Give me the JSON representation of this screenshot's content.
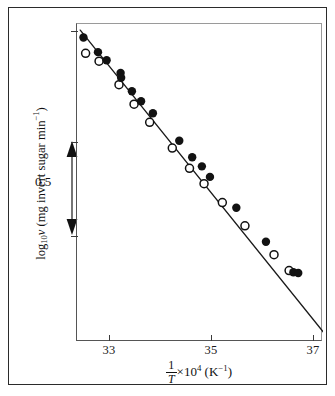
{
  "figure": {
    "domain": "chart",
    "background": "#ffffff",
    "border_color": "#2b2b2b"
  },
  "axes": {
    "x": {
      "title_prefix": "",
      "title_numerator": "1",
      "title_denominator": "T",
      "title_multiplier": "×10",
      "title_exponent": "4",
      "title_units": "(K",
      "title_units_exponent": "−1",
      "title_units_close": ")",
      "ticks": [
        {
          "value": 33,
          "label": "33",
          "pos_frac": 0.1341
        },
        {
          "value": 35,
          "label": "35",
          "pos_frac": 0.5488
        },
        {
          "value": 37,
          "label": "37",
          "pos_frac": 0.9634
        }
      ],
      "range": [
        32.61,
        37.18
      ]
    },
    "y": {
      "title_main": "log",
      "title_sub": "10",
      "title_var": "ν",
      "title_rest": "(mg invert sugar min",
      "title_rest_exp": "−1",
      "title_rest_close": ")",
      "scalebar_label": "0.5",
      "scalebar_span_value": 0.5,
      "ticks_y_px": [
        7,
        118,
        212
      ]
    }
  },
  "chart_data": {
    "type": "scatter",
    "title": "",
    "xlabel": "1/T ×10⁴ (K⁻¹)",
    "ylabel": "log10 ν (mg invert sugar min⁻¹)",
    "xlim": [
      32.61,
      37.18
    ],
    "ylim_relative": [
      -0.68,
      0.62
    ],
    "grid": false,
    "legend": false,
    "note": "Arrhenius plot; y values are relative log10 rate, anchored so the 0.5 scale bar spans 0.5 decades",
    "fit_line": {
      "label": "least-squares line",
      "x_start": 32.67,
      "y_start": 0.595,
      "x_end": 37.28,
      "y_end": -0.665,
      "slope": -0.2733
    },
    "series": [
      {
        "name": "filled circles",
        "marker": "filled-circle",
        "color": "#121212",
        "points": [
          [
            32.73,
            0.565
          ],
          [
            33.0,
            0.505
          ],
          [
            33.16,
            0.472
          ],
          [
            33.42,
            0.42
          ],
          [
            33.43,
            0.4
          ],
          [
            33.63,
            0.345
          ],
          [
            33.8,
            0.304
          ],
          [
            34.02,
            0.255
          ],
          [
            34.51,
            0.143
          ],
          [
            34.75,
            0.075
          ],
          [
            34.93,
            0.038
          ],
          [
            35.08,
            -0.005
          ],
          [
            35.57,
            -0.131
          ],
          [
            36.12,
            -0.27
          ],
          [
            36.63,
            -0.395
          ],
          [
            36.72,
            -0.398
          ]
        ]
      },
      {
        "name": "open circles",
        "marker": "open-circle",
        "color": "#111111",
        "points": [
          [
            32.77,
            0.5
          ],
          [
            33.02,
            0.468
          ],
          [
            33.39,
            0.372
          ],
          [
            33.67,
            0.292
          ],
          [
            33.96,
            0.218
          ],
          [
            34.38,
            0.113
          ],
          [
            34.7,
            0.03
          ],
          [
            34.97,
            -0.033
          ],
          [
            35.31,
            -0.11
          ],
          [
            35.73,
            -0.205
          ],
          [
            36.27,
            -0.323
          ],
          [
            36.55,
            -0.388
          ]
        ]
      }
    ]
  }
}
